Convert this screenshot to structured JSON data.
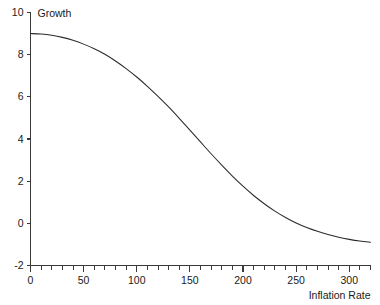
{
  "chart_data": {
    "type": "line",
    "title": "",
    "subtitle": "",
    "xlabel": "Inflation Rate",
    "ylabel": "Growth",
    "xlim": [
      0,
      320
    ],
    "ylim": [
      -2,
      10
    ],
    "grid": false,
    "legend": null,
    "legend_position": "none",
    "x_ticks": [
      0,
      50,
      100,
      150,
      200,
      250,
      300
    ],
    "x_tick_labels": [
      "0",
      "50",
      "100",
      "150",
      "200",
      "250",
      "300"
    ],
    "x_minor_tick_step": 10,
    "y_ticks": [
      -2,
      0,
      2,
      4,
      6,
      8,
      10
    ],
    "y_tick_labels": [
      "-2",
      "0",
      "2",
      "4",
      "6",
      "8",
      "10"
    ],
    "series": [
      {
        "name": "Growth vs Inflation Rate",
        "color": "#2b2b2b",
        "x": [
          0,
          10,
          20,
          30,
          40,
          50,
          60,
          70,
          80,
          90,
          100,
          110,
          120,
          130,
          140,
          150,
          160,
          170,
          180,
          190,
          200,
          210,
          220,
          230,
          240,
          250,
          260,
          270,
          280,
          290,
          300,
          310,
          320
        ],
        "y": [
          9.0,
          8.98,
          8.92,
          8.82,
          8.68,
          8.5,
          8.28,
          8.02,
          7.7,
          7.34,
          6.94,
          6.5,
          6.02,
          5.52,
          4.98,
          4.42,
          3.86,
          3.3,
          2.76,
          2.24,
          1.76,
          1.32,
          0.93,
          0.58,
          0.28,
          0.02,
          -0.2,
          -0.38,
          -0.53,
          -0.66,
          -0.76,
          -0.84,
          -0.9
        ]
      }
    ]
  },
  "axis_colors": {
    "line": "#3a3a3a",
    "text": "#1a1a1a",
    "background": "#ffffff"
  }
}
